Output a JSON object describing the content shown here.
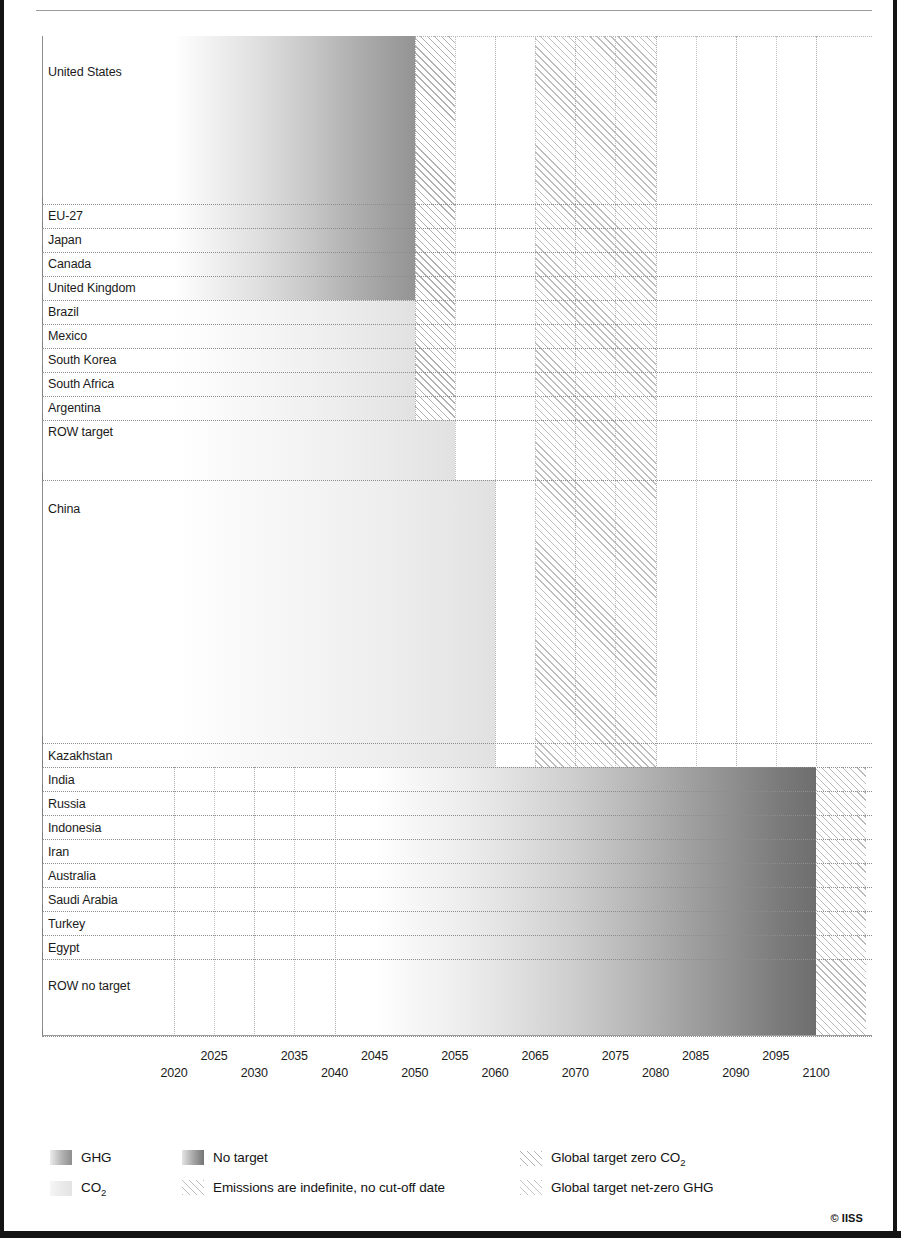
{
  "credit": "© IISS",
  "axis": {
    "ticks": [
      2020,
      2025,
      2030,
      2035,
      2040,
      2045,
      2050,
      2055,
      2060,
      2065,
      2070,
      2075,
      2080,
      2085,
      2090,
      2095,
      2100
    ],
    "min": 2018,
    "max": 2103
  },
  "legend": {
    "ghg": "GHG",
    "co2_pre": "CO",
    "co2_sub": "2",
    "no_target": "No target",
    "indefinite": "Emissions are indefinite, no cut-off date",
    "global_co2_pre": "Global target zero CO",
    "global_co2_sub": "2",
    "global_ghg": "Global target net-zero GHG"
  },
  "chart_data": {
    "type": "bar",
    "title": "",
    "xlabel": "",
    "ylabel": "",
    "orientation": "horizontal",
    "xlim": [
      2018,
      2103
    ],
    "grid": "vertical dotted every 5 years",
    "legend_position": "bottom",
    "categories": [
      "United States",
      "EU-27",
      "Japan",
      "Canada",
      "United Kingdom",
      "Brazil",
      "Mexico",
      "South Korea",
      "South Africa",
      "Argentina",
      "ROW target",
      "China",
      "Kazakhstan",
      "India",
      "Russia",
      "Indonesia",
      "Iran",
      "Australia",
      "Saudi Arabia",
      "Turkey",
      "Egypt",
      "ROW no target"
    ],
    "bars": [
      {
        "label": "United States",
        "group": "GHG",
        "start": 2020,
        "end": 2050,
        "indefinite": false,
        "height_rows": 7.0,
        "label_row": 6.0
      },
      {
        "label": "EU-27",
        "group": "GHG",
        "start": 2020,
        "end": 2050,
        "indefinite": false,
        "height_rows": 1,
        "label_row": 1
      },
      {
        "label": "Japan",
        "group": "GHG",
        "start": 2020,
        "end": 2050,
        "indefinite": false,
        "height_rows": 1,
        "label_row": 1
      },
      {
        "label": "Canada",
        "group": "GHG",
        "start": 2020,
        "end": 2050,
        "indefinite": false,
        "height_rows": 1,
        "label_row": 1
      },
      {
        "label": "United Kingdom",
        "group": "GHG",
        "start": 2020,
        "end": 2050,
        "indefinite": false,
        "height_rows": 1,
        "label_row": 1
      },
      {
        "label": "Brazil",
        "group": "CO2",
        "start": 2020,
        "end": 2050,
        "indefinite": false,
        "height_rows": 1,
        "label_row": 1
      },
      {
        "label": "Mexico",
        "group": "CO2",
        "start": 2020,
        "end": 2050,
        "indefinite": false,
        "height_rows": 1,
        "label_row": 1
      },
      {
        "label": "South Korea",
        "group": "CO2",
        "start": 2020,
        "end": 2050,
        "indefinite": false,
        "height_rows": 1,
        "label_row": 1
      },
      {
        "label": "South Africa",
        "group": "CO2",
        "start": 2020,
        "end": 2050,
        "indefinite": false,
        "height_rows": 1,
        "label_row": 1
      },
      {
        "label": "Argentina",
        "group": "CO2",
        "start": 2020,
        "end": 2050,
        "indefinite": false,
        "height_rows": 1,
        "label_row": 1
      },
      {
        "label": "ROW target",
        "group": "CO2",
        "start": 2020,
        "end": 2055,
        "indefinite": false,
        "height_rows": 2.5,
        "label_row": 2.5
      },
      {
        "label": "China",
        "group": "CO2",
        "start": 2020,
        "end": 2060,
        "indefinite": false,
        "height_rows": 11.0,
        "label_row": 10.3
      },
      {
        "label": "Kazakhstan",
        "group": "CO2",
        "start": 2020,
        "end": 2060,
        "indefinite": false,
        "height_rows": 1,
        "label_row": 1
      },
      {
        "label": "India",
        "group": "No target",
        "start": 2045,
        "end": 2100,
        "indefinite": true,
        "height_rows": 1,
        "label_row": 1
      },
      {
        "label": "Russia",
        "group": "No target",
        "start": 2045,
        "end": 2100,
        "indefinite": true,
        "height_rows": 1,
        "label_row": 1
      },
      {
        "label": "Indonesia",
        "group": "No target",
        "start": 2045,
        "end": 2100,
        "indefinite": true,
        "height_rows": 1,
        "label_row": 1
      },
      {
        "label": "Iran",
        "group": "No target",
        "start": 2045,
        "end": 2100,
        "indefinite": true,
        "height_rows": 1,
        "label_row": 1
      },
      {
        "label": "Australia",
        "group": "No target",
        "start": 2045,
        "end": 2100,
        "indefinite": true,
        "height_rows": 1,
        "label_row": 1
      },
      {
        "label": "Saudi Arabia",
        "group": "No target",
        "start": 2045,
        "end": 2100,
        "indefinite": true,
        "height_rows": 1,
        "label_row": 1
      },
      {
        "label": "Turkey",
        "group": "No target",
        "start": 2045,
        "end": 2100,
        "indefinite": true,
        "height_rows": 1,
        "label_row": 1
      },
      {
        "label": "Egypt",
        "group": "No target",
        "start": 2045,
        "end": 2100,
        "indefinite": true,
        "height_rows": 1,
        "label_row": 1
      },
      {
        "label": "ROW no target",
        "group": "No target",
        "start": 2045,
        "end": 2100,
        "indefinite": true,
        "height_rows": 3.2,
        "label_row": 2.6
      }
    ],
    "reference_bands": [
      {
        "name": "Global target zero CO2",
        "start": 2050,
        "end": 2055
      },
      {
        "name": "Global target net-zero GHG",
        "start": 2065,
        "end": 2080
      }
    ],
    "notes": [
      "Bar width encodes time until the stated net-zero target year; shading darkens toward the target date.",
      "No-target countries' emissions run past 2100 and are shown as indefinite hatching."
    ]
  }
}
